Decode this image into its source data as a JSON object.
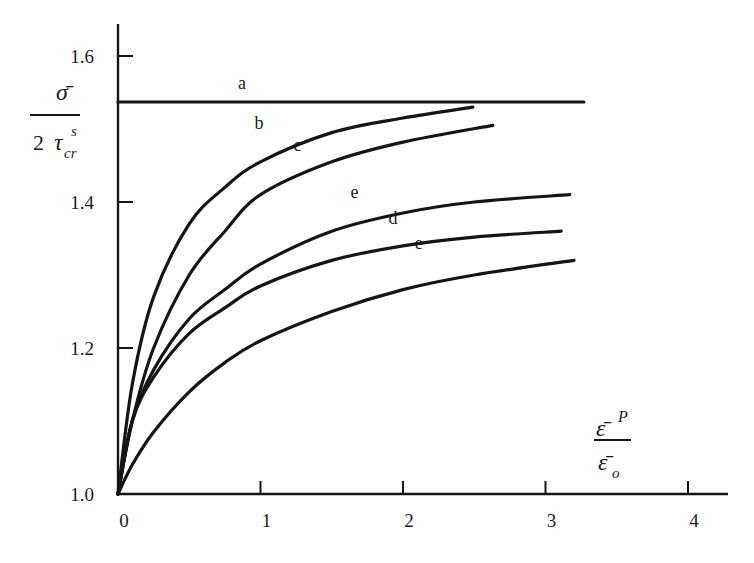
{
  "chart_data": {
    "type": "line",
    "title": "",
    "xlabel": "ε̄^P / ε̄_o",
    "ylabel": "σ̄ / 2 τ_cr^s",
    "xlim": [
      0,
      4.3
    ],
    "ylim": [
      1.0,
      1.65
    ],
    "x_ticks": [
      "0",
      "1",
      "2",
      "3",
      "4"
    ],
    "y_ticks": [
      "1.0",
      "1.2",
      "1.4",
      "1.6"
    ],
    "grid": false,
    "legend": "inline curve labels",
    "series": [
      {
        "name": "a",
        "x": [
          0,
          3.27
        ],
        "values": [
          1.537,
          1.537
        ]
      },
      {
        "name": "b",
        "x": [
          0,
          0.1,
          0.25,
          0.5,
          0.75,
          1.0,
          1.5,
          2.0,
          2.49
        ],
        "values": [
          1.0,
          1.15,
          1.27,
          1.37,
          1.42,
          1.455,
          1.495,
          1.515,
          1.53
        ]
      },
      {
        "name": "c",
        "x": [
          0,
          0.1,
          0.25,
          0.5,
          0.75,
          1.0,
          1.5,
          2.0,
          2.63
        ],
        "values": [
          1.0,
          1.1,
          1.2,
          1.3,
          1.36,
          1.41,
          1.455,
          1.482,
          1.505
        ]
      },
      {
        "name": "e (upper)",
        "x": [
          0,
          0.1,
          0.25,
          0.5,
          0.75,
          1.0,
          1.5,
          2.0,
          2.5,
          3.17
        ],
        "values": [
          1.0,
          1.1,
          1.17,
          1.24,
          1.28,
          1.315,
          1.36,
          1.385,
          1.4,
          1.41
        ]
      },
      {
        "name": "d",
        "x": [
          0,
          0.1,
          0.25,
          0.5,
          0.75,
          1.0,
          1.5,
          2.0,
          2.5,
          3.11
        ],
        "values": [
          1.0,
          1.1,
          1.16,
          1.22,
          1.255,
          1.285,
          1.32,
          1.34,
          1.352,
          1.36
        ]
      },
      {
        "name": "e (lower)",
        "x": [
          0,
          0.1,
          0.25,
          0.5,
          0.75,
          1.0,
          1.5,
          2.0,
          2.5,
          3.2
        ],
        "values": [
          1.0,
          1.04,
          1.085,
          1.14,
          1.18,
          1.21,
          1.25,
          1.28,
          1.3,
          1.32
        ]
      }
    ],
    "curve_labels": [
      {
        "text": "a",
        "x": 0.87,
        "y": 1.555
      },
      {
        "text": "b",
        "x": 0.99,
        "y": 1.5
      },
      {
        "text": "c",
        "x": 1.26,
        "y": 1.47
      },
      {
        "text": "e",
        "x": 1.66,
        "y": 1.405
      },
      {
        "text": "d",
        "x": 1.93,
        "y": 1.37
      },
      {
        "text": "e",
        "x": 2.11,
        "y": 1.335
      }
    ]
  },
  "axes": {
    "y_label_numerator": "σ̄",
    "y_label_denominator_num": "2",
    "y_label_denominator_sym": "τ",
    "y_label_sub": "cr",
    "y_label_sup": "s",
    "x_label_num_sym": "ε̄",
    "x_label_num_sup": "P",
    "x_label_den_sym": "ε̄",
    "x_label_den_sub": "o"
  }
}
